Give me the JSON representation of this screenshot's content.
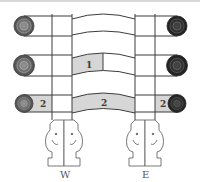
{
  "colors": {
    "line": "#3c3c3c",
    "shade": "#d6d6d6",
    "spiral_light": "#6e6e6e",
    "spiral_dark": "#2a2a2a",
    "background": "#ffffff"
  },
  "rows": [
    {
      "name": "top-row",
      "left_spiral": "light",
      "right_spiral": "dark",
      "left_label": "",
      "middle_label": "",
      "right_label": "",
      "shade_left": false,
      "shade_middle": "none",
      "shade_right": false
    },
    {
      "name": "middle-row",
      "left_spiral": "light",
      "right_spiral": "dark",
      "left_label": "",
      "middle_label": "1",
      "right_label": "",
      "shade_left": false,
      "shade_middle": "partial",
      "shade_right": false
    },
    {
      "name": "bottom-row",
      "left_spiral": "light",
      "right_spiral": "dark",
      "left_label": "2",
      "middle_label": "2",
      "right_label": "2",
      "shade_left": true,
      "shade_middle": "full",
      "shade_right": true
    }
  ],
  "supports": {
    "west": {
      "label": "W",
      "figure": "elephant-pair-icon"
    },
    "east": {
      "label": "E",
      "figure": "elephant-pair-icon"
    }
  }
}
